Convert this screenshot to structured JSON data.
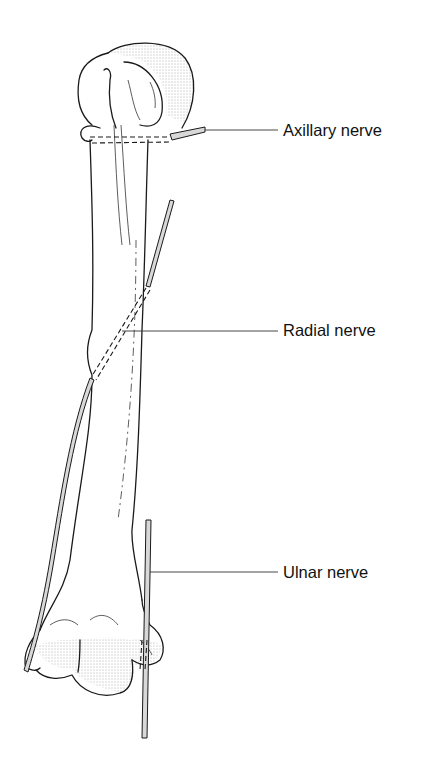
{
  "figure": {
    "labels": [
      {
        "id": "axillary",
        "text": "Axillary nerve",
        "x": 283,
        "y": 122,
        "leader_from": [
          205,
          130
        ],
        "leader_to": [
          278,
          130
        ]
      },
      {
        "id": "radial",
        "text": "Radial nerve",
        "x": 283,
        "y": 322,
        "leader_from": [
          122,
          331
        ],
        "leader_to": [
          278,
          331
        ]
      },
      {
        "id": "ulnar",
        "text": "Ulnar nerve",
        "x": 283,
        "y": 564,
        "leader_from": [
          150,
          572
        ],
        "leader_to": [
          278,
          572
        ]
      }
    ]
  }
}
